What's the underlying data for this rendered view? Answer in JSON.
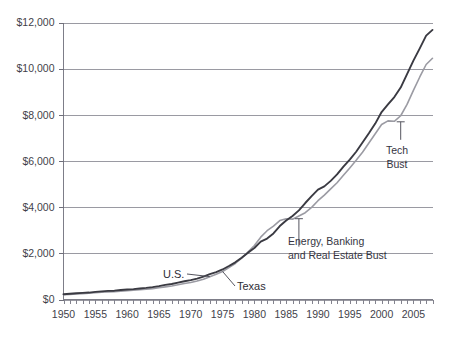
{
  "chart_data": {
    "type": "line",
    "title": "",
    "subtitle": "",
    "xlabel": "",
    "ylabel": "",
    "xlim": [
      1950,
      2008
    ],
    "ylim": [
      0,
      12000
    ],
    "grid": true,
    "legend_position": "inline-annotations",
    "y_tick_labels": [
      "$0",
      "$2,000",
      "$4,000",
      "$6,000",
      "$8,000",
      "$10,000",
      "$12,000"
    ],
    "y_tick_values": [
      0,
      2000,
      4000,
      6000,
      8000,
      10000,
      12000
    ],
    "x_tick_labels": [
      "1950",
      "1955",
      "1960",
      "1965",
      "1970",
      "1975",
      "1980",
      "1985",
      "1990",
      "1995",
      "2000",
      "2005"
    ],
    "x_tick_values": [
      1950,
      1955,
      1960,
      1965,
      1970,
      1975,
      1980,
      1985,
      1990,
      1995,
      2000,
      2005
    ],
    "x_minor_tick_step": 1,
    "x": [
      1950,
      1951,
      1952,
      1953,
      1954,
      1955,
      1956,
      1957,
      1958,
      1959,
      1960,
      1961,
      1962,
      1963,
      1964,
      1965,
      1966,
      1967,
      1968,
      1969,
      1970,
      1971,
      1972,
      1973,
      1974,
      1975,
      1976,
      1977,
      1978,
      1979,
      1980,
      1981,
      1982,
      1983,
      1984,
      1985,
      1986,
      1987,
      1988,
      1989,
      1990,
      1991,
      1992,
      1993,
      1994,
      1995,
      1996,
      1997,
      1998,
      1999,
      2000,
      2001,
      2002,
      2003,
      2004,
      2005,
      2006,
      2007,
      2008
    ],
    "series": [
      {
        "name": "U.S.",
        "color": "#3a3a42",
        "values": [
          230,
          250,
          268,
          288,
          300,
          330,
          352,
          372,
          382,
          412,
          432,
          448,
          478,
          502,
          538,
          582,
          635,
          672,
          730,
          790,
          840,
          905,
          990,
          1100,
          1190,
          1300,
          1450,
          1610,
          1810,
          2030,
          2230,
          2510,
          2640,
          2860,
          3180,
          3420,
          3620,
          3860,
          4180,
          4480,
          4760,
          4900,
          5140,
          5420,
          5760,
          6060,
          6400,
          6800,
          7200,
          7620,
          8120,
          8450,
          8770,
          9180,
          9760,
          10350,
          10880,
          11430,
          11680
        ]
      },
      {
        "name": "Texas",
        "color": "#9b9ba3",
        "values": [
          205,
          222,
          240,
          256,
          268,
          292,
          312,
          330,
          342,
          364,
          382,
          398,
          420,
          442,
          470,
          506,
          548,
          585,
          636,
          690,
          740,
          800,
          878,
          985,
          1095,
          1215,
          1380,
          1560,
          1790,
          2060,
          2340,
          2700,
          2980,
          3180,
          3420,
          3500,
          3480,
          3620,
          3760,
          3990,
          4280,
          4520,
          4790,
          5060,
          5380,
          5700,
          6030,
          6380,
          6780,
          7180,
          7580,
          7740,
          7720,
          7960,
          8450,
          9060,
          9640,
          10180,
          10450
        ]
      }
    ],
    "annotations": [
      {
        "id": "tech-bust",
        "text_lines": [
          "Tech",
          "Bust"
        ],
        "target_x": 2003,
        "target_y": 7700
      },
      {
        "id": "energy-banking-bust",
        "text_lines": [
          "Energy, Banking",
          "and Real Estate Bust"
        ],
        "target_x": 1987,
        "target_y": 3500
      }
    ],
    "series_labels": [
      {
        "id": "us-label",
        "text": "U.S.",
        "target_x": 1973,
        "target_y": 990
      },
      {
        "id": "texas-label",
        "text": "Texas",
        "target_x": 1975,
        "target_y": 1215
      }
    ]
  }
}
